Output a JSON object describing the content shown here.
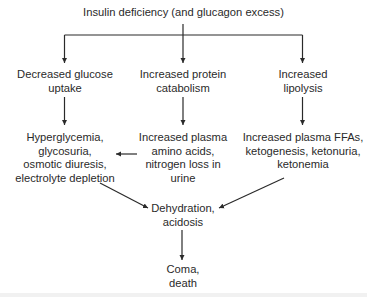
{
  "diagram": {
    "type": "flowchart",
    "nodes": {
      "root": {
        "lines": [
          "Insulin deficiency (and glucagon excess)"
        ]
      },
      "glucose": {
        "lines": [
          "Decreased glucose",
          "uptake"
        ]
      },
      "protein": {
        "lines": [
          "Increased protein",
          "catabolism"
        ]
      },
      "lipolysis": {
        "lines": [
          "Increased",
          "lipolysis"
        ]
      },
      "hyperglycemia": {
        "lines": [
          "Hyperglycemia,",
          "glycosuria,",
          "osmotic diuresis,",
          "electrolyte depletion"
        ]
      },
      "amino": {
        "lines": [
          "Increased plasma",
          "amino acids,",
          "nitrogen loss in",
          "urine"
        ]
      },
      "ffa": {
        "lines": [
          "Increased plasma FFAs,",
          "ketogenesis, ketonuria,",
          "ketonemia"
        ]
      },
      "dehydration": {
        "lines": [
          "Dehydration,",
          "acidosis"
        ]
      },
      "coma": {
        "lines": [
          "Coma,",
          "death"
        ]
      }
    },
    "edges": [
      {
        "from": "root",
        "to": "glucose"
      },
      {
        "from": "root",
        "to": "protein"
      },
      {
        "from": "root",
        "to": "lipolysis"
      },
      {
        "from": "glucose",
        "to": "hyperglycemia"
      },
      {
        "from": "protein",
        "to": "amino"
      },
      {
        "from": "lipolysis",
        "to": "ffa"
      },
      {
        "from": "amino",
        "to": "hyperglycemia"
      },
      {
        "from": "hyperglycemia",
        "to": "dehydration"
      },
      {
        "from": "ffa",
        "to": "dehydration"
      },
      {
        "from": "dehydration",
        "to": "coma"
      }
    ],
    "colors": {
      "line": "#2a2a2a",
      "text": "#2a2a2a"
    }
  }
}
